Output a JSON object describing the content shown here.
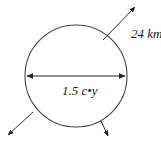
{
  "diagram": {
    "type": "sphere-expansion",
    "diameter_label": "1.5 c•y",
    "velocity_label": "24 km",
    "stroke_color": "#333333",
    "background": "#ffffff"
  }
}
